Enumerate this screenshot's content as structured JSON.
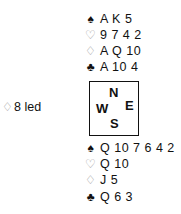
{
  "north": {
    "spades": "A K 5",
    "hearts": "9 7 4 2",
    "diamonds": "A Q 10",
    "clubs": "A 10 4"
  },
  "south": {
    "spades": "Q 10 7 6 4 2",
    "hearts": "Q 10",
    "diamonds": "J 5",
    "clubs": "Q 6 3"
  },
  "lead": {
    "suit_symbol": "♢",
    "text": "8 led"
  },
  "compass": {
    "n": "N",
    "s": "S",
    "w": "W",
    "e": "E"
  },
  "symbols": {
    "spade": "♠",
    "heart": "♡",
    "diamond": "♢",
    "club": "♣"
  }
}
